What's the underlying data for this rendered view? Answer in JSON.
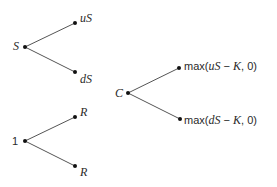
{
  "diagram": {
    "type": "binomial-trees",
    "trees": [
      {
        "root": "S",
        "up": "uS",
        "down": "dS"
      },
      {
        "root": "1",
        "up": "R",
        "down": "R"
      },
      {
        "root": "C",
        "up": "max(uS − K, 0)",
        "down": "max(dS − K, 0)"
      }
    ]
  },
  "labels": {
    "s_root": "S",
    "s_up": "uS",
    "s_down": "dS",
    "b_root": "1",
    "b_up": "R",
    "b_down": "R",
    "c_root": "C",
    "c_up_fn": "max(",
    "c_up_var": "uS",
    "c_up_rest": " − ",
    "c_up_k": "K",
    "c_up_end": ", 0)",
    "c_down_fn": "max(",
    "c_down_var": "dS",
    "c_down_rest": " − ",
    "c_down_k": "K",
    "c_down_end": ", 0)"
  },
  "colors": {
    "line": "#555555",
    "node": "#111111"
  }
}
